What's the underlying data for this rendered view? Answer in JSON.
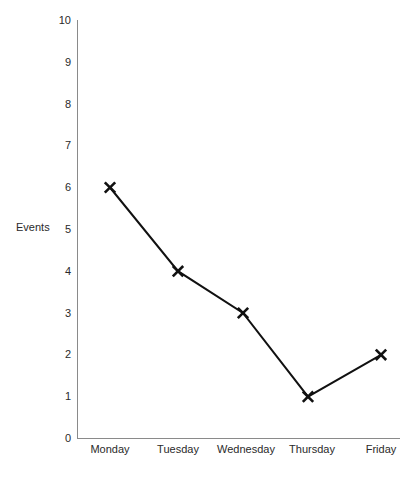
{
  "chart_data": {
    "type": "line",
    "title": "",
    "xlabel": "",
    "ylabel": "Events",
    "categories": [
      "Monday",
      "Tuesday",
      "Wednesday",
      "Thursday",
      "Friday"
    ],
    "values": [
      6,
      4,
      3,
      1,
      2
    ],
    "ylim": [
      0,
      10
    ],
    "yticks": [
      "0",
      "1",
      "2",
      "3",
      "4",
      "5",
      "6",
      "7",
      "8",
      "9",
      "10"
    ],
    "grid": false,
    "legend": "none",
    "marker": "x",
    "line_color": "#111111",
    "axis_color": "#8a8a8a",
    "background": "#ffffff"
  },
  "axis": {
    "y_label": "Events",
    "y_ticks": [
      {
        "value": "10"
      },
      {
        "value": "9"
      },
      {
        "value": "8"
      },
      {
        "value": "7"
      },
      {
        "value": "6"
      },
      {
        "value": "5"
      },
      {
        "value": "4"
      },
      {
        "value": "3"
      },
      {
        "value": "2"
      },
      {
        "value": "1"
      },
      {
        "value": "0"
      }
    ],
    "x_ticks": [
      {
        "label": "Monday"
      },
      {
        "label": "Tuesday"
      },
      {
        "label": "Wednesday"
      },
      {
        "label": "Thursday"
      },
      {
        "label": "Friday"
      }
    ]
  }
}
